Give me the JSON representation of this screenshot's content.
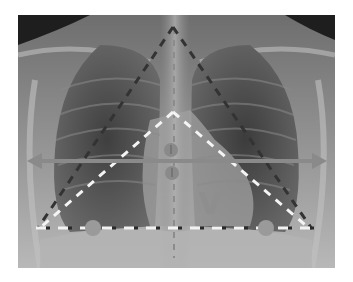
{
  "image": {
    "subject": "Chest X-ray (PA view) with geometric annotations",
    "background": "#ffffff",
    "frame": {
      "x": 18,
      "y": 15,
      "width": 317,
      "height": 253
    }
  },
  "annotations": {
    "outer_triangle": {
      "style": "dashed",
      "color": "#3a3a3a",
      "apex": [
        173,
        27
      ],
      "left": [
        38,
        228
      ],
      "right": [
        312,
        229
      ]
    },
    "inner_triangle": {
      "style": "dashed",
      "color": "#f2f2f2",
      "apex": [
        173,
        112
      ],
      "left": [
        40,
        228
      ],
      "right": [
        310,
        229
      ]
    },
    "base_line": {
      "style": "dashed-alternating",
      "colors": [
        "#f2f2f2",
        "#2a2a2a"
      ],
      "y": 228,
      "x1": 36,
      "x2": 314
    },
    "horizontal_arrow": {
      "style": "double-headed",
      "color": "#8a8a8a",
      "y": 161,
      "x1": 28,
      "x2": 326
    },
    "vertical_line": {
      "style": "dashed",
      "color": "#8c8c8c",
      "x": 174,
      "y1": 28,
      "y2": 258
    },
    "circles": [
      {
        "cx": 171,
        "cy": 150,
        "r": 7,
        "color": "#8a8a8a"
      },
      {
        "cx": 172,
        "cy": 173,
        "r": 7,
        "color": "#8a8a8a"
      },
      {
        "cx": 93,
        "cy": 228,
        "r": 8,
        "color": "#9a9a9a"
      },
      {
        "cx": 266,
        "cy": 228,
        "r": 8,
        "color": "#9a9a9a"
      }
    ],
    "label": {
      "text": "V",
      "x": 210,
      "y": 213,
      "color": "#8e8e8e"
    }
  }
}
